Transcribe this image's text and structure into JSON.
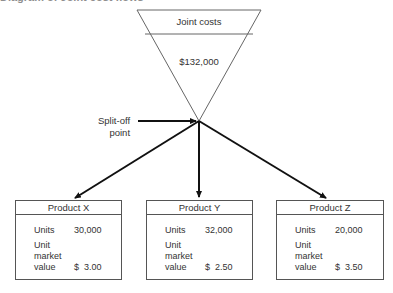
{
  "figure": {
    "title_fragment": "Diagram of Joint cost flows"
  },
  "joint_costs": {
    "label": "Joint costs",
    "amount": "$132,000"
  },
  "split_off": {
    "label_line1": "Split-off",
    "label_line2": "point"
  },
  "products": [
    {
      "name": "Product X",
      "units_label": "Units",
      "units": "30,000",
      "umv_line1": "Unit",
      "umv_line2": "market",
      "umv_line3": "value",
      "price": "$  3.00"
    },
    {
      "name": "Product Y",
      "units_label": "Units",
      "units": "32,000",
      "umv_line1": "Unit",
      "umv_line2": "market",
      "umv_line3": "value",
      "price": "$  2.50"
    },
    {
      "name": "Product Z",
      "units_label": "Units",
      "units": "20,000",
      "umv_line1": "Unit",
      "umv_line2": "market",
      "umv_line3": "value",
      "price": "$  3.50"
    }
  ],
  "colors": {
    "line": "#555555",
    "arrow": "#111111",
    "text": "#333333"
  }
}
